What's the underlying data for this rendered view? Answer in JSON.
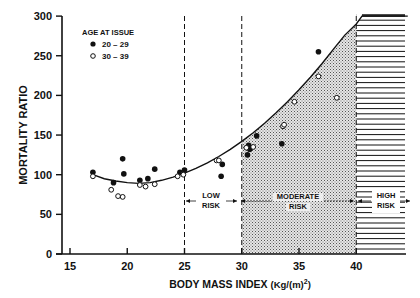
{
  "chart_data": {
    "type": "scatter",
    "title": "",
    "xlabel": "BODY MASS INDEX (Kg/(m)²)",
    "ylabel": "MORTALITY RATIO",
    "xlim": [
      14.5,
      44.5
    ],
    "ylim": [
      0,
      300
    ],
    "x_ticks": [
      15,
      20,
      25,
      30,
      35,
      40
    ],
    "y_ticks": [
      0,
      50,
      100,
      150,
      200,
      250,
      300
    ],
    "grid": false,
    "legend": {
      "title": "AGE AT ISSUE",
      "position": "upper-left",
      "entries": [
        {
          "label": "20-29",
          "marker": "filled-circle"
        },
        {
          "label": "30-39",
          "marker": "open-circle"
        }
      ]
    },
    "series": [
      {
        "name": "20-29",
        "marker": "filled-circle",
        "points": [
          [
            17.0,
            103
          ],
          [
            18.8,
            90
          ],
          [
            19.6,
            120
          ],
          [
            19.7,
            101
          ],
          [
            21.1,
            93
          ],
          [
            21.8,
            95
          ],
          [
            22.4,
            107
          ],
          [
            24.6,
            103
          ],
          [
            25.0,
            106
          ],
          [
            28.3,
            113
          ],
          [
            28.2,
            98
          ],
          [
            30.6,
            137
          ],
          [
            30.7,
            132
          ],
          [
            30.5,
            125
          ],
          [
            31.3,
            149
          ],
          [
            33.5,
            139
          ],
          [
            36.7,
            255
          ]
        ]
      },
      {
        "name": "30-39",
        "marker": "open-circle",
        "points": [
          [
            17.0,
            98
          ],
          [
            18.6,
            81
          ],
          [
            19.2,
            73
          ],
          [
            19.6,
            72
          ],
          [
            21.1,
            87
          ],
          [
            21.6,
            85
          ],
          [
            22.4,
            88
          ],
          [
            24.4,
            98
          ],
          [
            24.9,
            100
          ],
          [
            27.8,
            118
          ],
          [
            28.0,
            118
          ],
          [
            30.4,
            134
          ],
          [
            31.0,
            135
          ],
          [
            33.6,
            161
          ],
          [
            33.7,
            163
          ],
          [
            34.6,
            192
          ],
          [
            36.7,
            224
          ],
          [
            38.3,
            197
          ]
        ]
      }
    ],
    "fitted_curve": {
      "name": "fitted curve",
      "points": [
        [
          17.0,
          100
        ],
        [
          18.0,
          95
        ],
        [
          19.0,
          92
        ],
        [
          20.0,
          90
        ],
        [
          21.0,
          89
        ],
        [
          22.0,
          90
        ],
        [
          23.0,
          93
        ],
        [
          24.0,
          97
        ],
        [
          25.0,
          102
        ],
        [
          26.0,
          108
        ],
        [
          27.0,
          115
        ],
        [
          28.0,
          123
        ],
        [
          29.0,
          132
        ],
        [
          30.0,
          142
        ],
        [
          31.0,
          153
        ],
        [
          32.0,
          165
        ],
        [
          33.0,
          178
        ],
        [
          34.0,
          192
        ],
        [
          35.0,
          207
        ],
        [
          36.0,
          223
        ],
        [
          37.0,
          240
        ],
        [
          38.0,
          258
        ],
        [
          39.0,
          276
        ],
        [
          40.0,
          290
        ],
        [
          40.5,
          300
        ]
      ]
    },
    "reference_lines": [
      {
        "x": 25,
        "style": "dashed"
      },
      {
        "x": 30,
        "style": "dashed"
      },
      {
        "x": 40,
        "style": "dashed"
      }
    ],
    "regions": [
      {
        "label_line1": "LOW",
        "label_line2": "RISK",
        "x_range": [
          25,
          30
        ],
        "fill": "none"
      },
      {
        "label_line1": "MODERATE",
        "label_line2": "RISK",
        "x_range": [
          30,
          40
        ],
        "fill": "stippled-below-curve"
      },
      {
        "label_line1": "HIGH",
        "label_line2": "RISK",
        "x_range": [
          40,
          44.5
        ],
        "fill": "horizontal-hatch"
      }
    ]
  },
  "labels": {
    "ylabel": "MORTALITY RATIO",
    "xlabel_main": "BODY MASS INDEX ",
    "xlabel_unit": "(Kg/(m)",
    "xlabel_sup": "2",
    "xlabel_close": ")",
    "legend_title": "AGE AT ISSUE",
    "legend_filled": "20 – 29",
    "legend_open": "30 – 39",
    "low_1": "LOW",
    "low_2": "RISK",
    "mod_1": "MODERATE",
    "mod_2": "RISK",
    "high_1": "HIGH",
    "high_2": "RISK",
    "xt": [
      "15",
      "20",
      "25",
      "30",
      "35",
      "40"
    ],
    "yt": [
      "0",
      "50",
      "100",
      "150",
      "200",
      "250",
      "300"
    ]
  }
}
